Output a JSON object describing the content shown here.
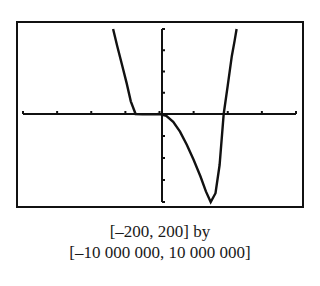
{
  "chart_data": {
    "type": "line",
    "title": "",
    "xlabel": "",
    "ylabel": "",
    "xlim": [
      -200,
      200
    ],
    "ylim": [
      -10000000,
      10000000
    ],
    "x_tick_step": 50,
    "y_tick_step": 2500000,
    "grid": false,
    "legend": null,
    "series": [
      {
        "name": "f(x)",
        "x": [
          -68,
          -62,
          -55,
          -48,
          -42,
          -35,
          -25,
          -15,
          -5,
          0,
          10,
          20,
          30,
          40,
          50,
          60,
          68,
          75,
          82,
          88,
          94,
          100,
          106,
          110,
          113
        ],
        "y": [
          10000000,
          8000000,
          5800000,
          3600000,
          1500000,
          0,
          -50000,
          -50000,
          -20000,
          0,
          -200000,
          -900000,
          -2000000,
          -3500000,
          -5200000,
          -7100000,
          -8800000,
          -10000000,
          -9000000,
          -5800000,
          0,
          3400000,
          6800000,
          8600000,
          10000000
        ]
      }
    ],
    "x_intercepts_approx": [
      -35,
      0,
      94
    ]
  },
  "caption": {
    "line1": "[–200, 200] by",
    "line2": "[–10 000 000, 10 000 000]"
  },
  "style": {
    "ink": "#111111",
    "frame_left": 17,
    "frame_top": 22,
    "frame_right": 303,
    "frame_bottom": 207,
    "axis_left": 23,
    "axis_right": 296,
    "axis_top": 29,
    "axis_bottom": 202,
    "origin_x": 162,
    "origin_y": 114
  }
}
